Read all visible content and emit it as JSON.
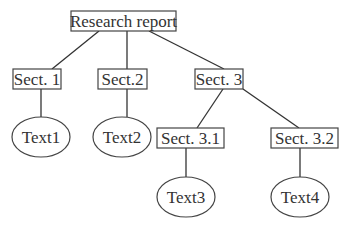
{
  "diagram": {
    "type": "tree",
    "nodes": [
      {
        "id": "root",
        "label": "Research report",
        "shape": "rect"
      },
      {
        "id": "s1",
        "label": "Sect. 1",
        "shape": "rect"
      },
      {
        "id": "s2",
        "label": "Sect.2",
        "shape": "rect"
      },
      {
        "id": "s3",
        "label": "Sect. 3",
        "shape": "rect"
      },
      {
        "id": "t1",
        "label": "Text1",
        "shape": "ellipse"
      },
      {
        "id": "t2",
        "label": "Text2",
        "shape": "ellipse"
      },
      {
        "id": "s31",
        "label": "Sect. 3.1",
        "shape": "rect"
      },
      {
        "id": "s32",
        "label": "Sect. 3.2",
        "shape": "rect"
      },
      {
        "id": "t3",
        "label": "Text3",
        "shape": "ellipse"
      },
      {
        "id": "t4",
        "label": "Text4",
        "shape": "ellipse"
      }
    ],
    "edges": [
      [
        "root",
        "s1"
      ],
      [
        "root",
        "s2"
      ],
      [
        "root",
        "s3"
      ],
      [
        "s1",
        "t1"
      ],
      [
        "s2",
        "t2"
      ],
      [
        "s3",
        "s31"
      ],
      [
        "s3",
        "s32"
      ],
      [
        "s31",
        "t3"
      ],
      [
        "s32",
        "t4"
      ]
    ]
  }
}
